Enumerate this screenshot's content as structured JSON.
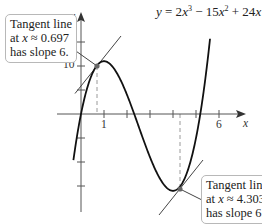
{
  "chart_data": {
    "type": "line",
    "title": "",
    "equation": {
      "lhs": "y",
      "text": "y = 2x^3 − 15x^2 + 24x",
      "parts": [
        "y",
        " = 2",
        "x",
        "3",
        " − 15",
        "x",
        "2",
        " + 24",
        "x"
      ]
    },
    "function": "y = 2x^3 - 15x^2 + 24x",
    "xlabel": "x",
    "ylabel": "y",
    "x_ticks": [
      1,
      2,
      3,
      4,
      5,
      6
    ],
    "x_tick_labels_shown": [
      "1",
      "6"
    ],
    "y_ticks": [
      -15,
      -10,
      -5,
      5,
      10,
      15
    ],
    "y_tick_labels_shown": [
      "10"
    ],
    "xlim": [
      -1.3,
      7.2
    ],
    "ylim": [
      -23,
      22
    ],
    "grid": false,
    "series": [
      {
        "name": "y = 2x^3 − 15x^2 + 24x",
        "x": [
          -0.3,
          0,
          0.5,
          0.697,
          1,
          1.5,
          2,
          2.5,
          3,
          3.5,
          4,
          4.303,
          4.5,
          5,
          5.5
        ],
        "y": [
          -8.6,
          0,
          8.75,
          10.0,
          11,
          9.0,
          4,
          -1.25,
          -9,
          -11.0,
          -16,
          -15.7,
          -15.0,
          -5,
          15.75
        ]
      }
    ],
    "tangent_lines": [
      {
        "x": 0.697,
        "y": 10.0,
        "slope": 6
      },
      {
        "x": 4.303,
        "y": -15.7,
        "slope": 6
      }
    ],
    "annotations": [
      {
        "text": "Tangent line at x ≈ 0.697 has slope 6.",
        "position": "upper-left"
      },
      {
        "text": "Tangent line at x ≈ 4.303 has slope 6.",
        "position": "lower-right"
      }
    ]
  },
  "labels": {
    "y_axis": "y",
    "x_axis": "x",
    "x_tick_1": "1",
    "x_tick_6": "6",
    "y_tick_10": "10",
    "eq_y": "y",
    "eq_eq": " = 2",
    "eq_x1": "x",
    "eq_p1": "3",
    "eq_m": " − 15",
    "eq_x2": "x",
    "eq_p2": "2",
    "eq_plus": " + 24",
    "eq_x3": "x"
  },
  "callouts": {
    "left": {
      "line1": "Tangent line",
      "at": "at ",
      "var": "x",
      "approx": " ≈ 0.697",
      "line3": "has slope 6."
    },
    "right": {
      "line1": "Tangent line",
      "at": "at ",
      "var": "x",
      "approx": " ≈ 4.303",
      "line3": "has slope 6."
    }
  },
  "colors": {
    "curve": "#111111",
    "axis": "#555555",
    "tangent": "#444444",
    "dashed": "#9a9a9a",
    "point": "#666666",
    "callout_border": "#b8b8b8"
  }
}
